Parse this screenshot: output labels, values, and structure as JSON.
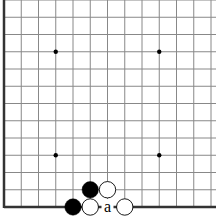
{
  "diagram": {
    "type": "go-board-corner",
    "grid": {
      "origin_x": 4,
      "origin_y": 207,
      "spacing": 17.25,
      "cols": 13,
      "rows": 13,
      "line_color": "#888888",
      "edge_color": "#333333"
    },
    "star_points": [
      [
        3,
        3
      ],
      [
        9,
        3
      ],
      [
        3,
        9
      ],
      [
        9,
        9
      ]
    ],
    "stones": [
      {
        "color": "black",
        "col": 5,
        "row": 1
      },
      {
        "color": "white",
        "col": 6,
        "row": 1
      },
      {
        "color": "black",
        "col": 4,
        "row": 0
      },
      {
        "color": "white",
        "col": 5,
        "row": 0
      },
      {
        "color": "white",
        "col": 7,
        "row": 0
      }
    ],
    "labels": [
      {
        "text": "a",
        "col": 6,
        "row": 0
      }
    ]
  }
}
